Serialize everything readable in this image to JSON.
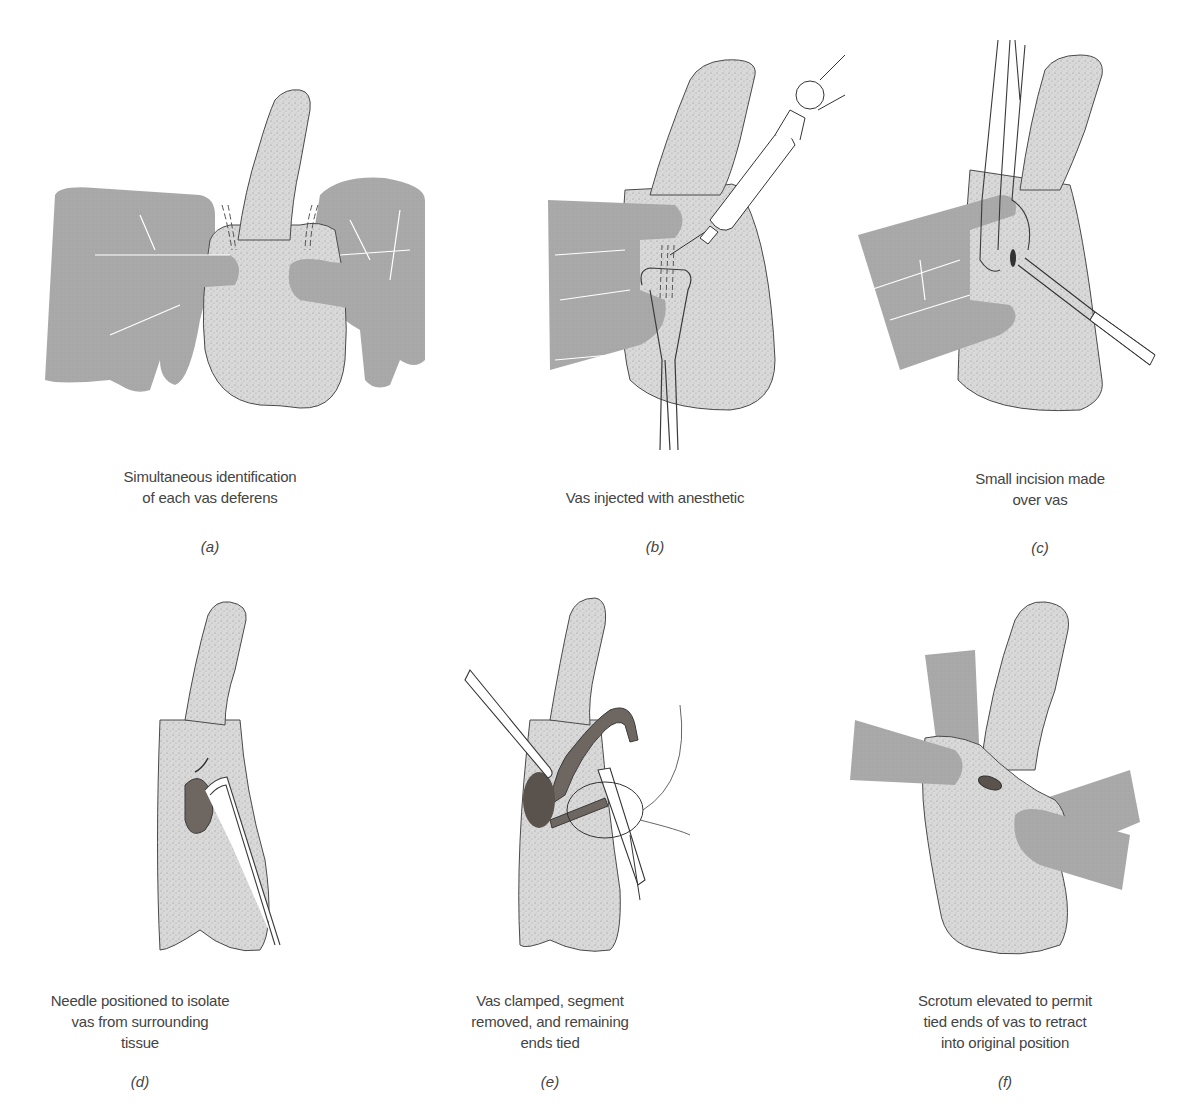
{
  "figure": {
    "colors": {
      "skin": "#d8d8d8",
      "skin_outline": "#4a4a4a",
      "hand": "#a9a9a9",
      "vas": "#6e6660",
      "instrument_outline": "#3a3a3a",
      "text": "#444444"
    },
    "panels": [
      {
        "id": "a",
        "label": "(a)",
        "caption": "Simultaneous identification\nof each vas deferens"
      },
      {
        "id": "b",
        "label": "(b)",
        "caption": "Vas injected with anesthetic"
      },
      {
        "id": "c",
        "label": "(c)",
        "caption": "Small incision made\nover vas"
      },
      {
        "id": "d",
        "label": "(d)",
        "caption": "Needle positioned to isolate\nvas from surrounding\ntissue"
      },
      {
        "id": "e",
        "label": "(e)",
        "caption": "Vas clamped, segment\nremoved, and remaining\nends tied"
      },
      {
        "id": "f",
        "label": "(f)",
        "caption": "Scrotum elevated to permit\ntied ends of vas to retract\ninto original position"
      }
    ]
  }
}
